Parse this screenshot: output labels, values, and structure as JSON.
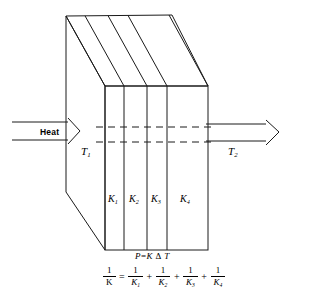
{
  "figure": {
    "type": "physics-schematic",
    "labels": {
      "heat": "Heat",
      "t1": "T",
      "t1_sub": "1",
      "t2": "T",
      "t2_sub": "2",
      "k1": "K",
      "k1_sub": "1",
      "k2": "K",
      "k2_sub": "2",
      "k3": "K",
      "k3_sub": "3",
      "k4": "K",
      "k4_sub": "4"
    },
    "equations": {
      "power": {
        "lhs": "P",
        "eq": "=",
        "k": "K",
        "delta": "Δ",
        "t": "T"
      },
      "resistance": {
        "lhs_num": "1",
        "lhs_den": "K",
        "eq": "=",
        "terms": [
          {
            "num": "1",
            "den": "K",
            "den_sub": "1"
          },
          {
            "num": "1",
            "den": "K",
            "den_sub": "2"
          },
          {
            "num": "1",
            "den": "K",
            "den_sub": "3"
          },
          {
            "num": "1",
            "den": "K",
            "den_sub": "4"
          }
        ],
        "plus": "+"
      }
    },
    "colors": {
      "stroke": "#1a1a1a",
      "background": "#ffffff",
      "dashed": "#1a1a1a"
    }
  }
}
